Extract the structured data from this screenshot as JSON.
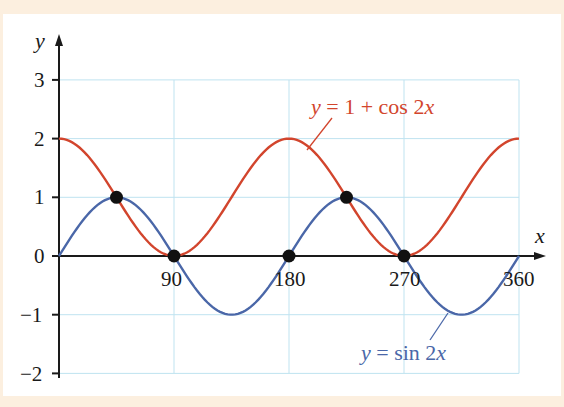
{
  "chart_data": {
    "type": "line",
    "title": "",
    "xlabel": "x",
    "ylabel": "y",
    "xlim": [
      0,
      360
    ],
    "ylim": [
      -2,
      3
    ],
    "grid": true,
    "x_ticks": [
      "90",
      "180",
      "270",
      "360"
    ],
    "y_ticks": [
      "3",
      "2",
      "1",
      "0",
      "−1",
      "−2"
    ],
    "series": [
      {
        "name": "y = 1 + cos 2x",
        "color": "#d2452d",
        "formula": "1 + cos(2x)",
        "x": [
          0,
          45,
          90,
          135,
          180,
          225,
          270,
          315,
          360
        ],
        "values": [
          2,
          1,
          0,
          1,
          2,
          1,
          0,
          1,
          2
        ]
      },
      {
        "name": "y = sin 2x",
        "color": "#4a67a8",
        "formula": "sin(2x)",
        "x": [
          0,
          45,
          90,
          135,
          180,
          225,
          270,
          315,
          360
        ],
        "values": [
          0,
          1,
          0,
          -1,
          0,
          1,
          0,
          -1,
          0
        ]
      }
    ],
    "intersection_points": [
      {
        "x": 45,
        "y": 1
      },
      {
        "x": 90,
        "y": 0
      },
      {
        "x": 180,
        "y": 0
      },
      {
        "x": 225,
        "y": 1
      },
      {
        "x": 270,
        "y": 0
      }
    ],
    "annotations": [
      "y = 1 + cos 2x",
      "y = sin 2x"
    ]
  },
  "labels": {
    "x_axis": "x",
    "y_axis": "y",
    "cos_label_y": "y",
    "cos_label_rest": " = 1 + cos 2",
    "cos_label_x": "x",
    "sin_label_y": "y",
    "sin_label_rest": " = sin 2",
    "sin_label_x": "x",
    "xt90": "90",
    "xt180": "180",
    "xt270": "270",
    "xt360": "360",
    "yt3": "3",
    "yt2": "2",
    "yt1": "1",
    "yt0": "0",
    "ytm1": "−1",
    "ytm2": "−2"
  }
}
